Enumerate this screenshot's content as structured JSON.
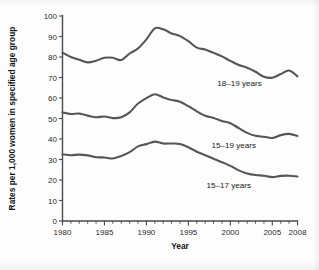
{
  "chart_data": {
    "type": "line",
    "title": "",
    "xlabel": "Year",
    "ylabel": "Rates per 1,000 women in specified age group",
    "xlim": [
      1980,
      2008
    ],
    "ylim": [
      0,
      100
    ],
    "ytick_step": 10,
    "grid": false,
    "legend_position": "inline-annotations",
    "x": [
      1980,
      1981,
      1982,
      1983,
      1984,
      1985,
      1986,
      1987,
      1988,
      1989,
      1990,
      1991,
      1992,
      1993,
      1994,
      1995,
      1996,
      1997,
      1998,
      1999,
      2000,
      2001,
      2002,
      2003,
      2004,
      2005,
      2006,
      2007,
      2008
    ],
    "xticks": [
      1980,
      1985,
      1990,
      1995,
      2000,
      2005,
      2008
    ],
    "xtick_labels": [
      "1980",
      "1985",
      "1990",
      "1995",
      "2000",
      "2005",
      "2008"
    ],
    "yticks": [
      0,
      10,
      20,
      30,
      40,
      50,
      60,
      70,
      80,
      90,
      100
    ],
    "ytick_labels": [
      "0",
      "10",
      "20",
      "30",
      "40",
      "50",
      "60",
      "70",
      "80",
      "90",
      "100"
    ],
    "series": [
      {
        "name": "18–19 years",
        "label": "18–19 years",
        "color": "#565656",
        "label_x": 2001.1,
        "label_y": 66.0,
        "values": [
          82.1,
          80.0,
          78.6,
          77.4,
          78.2,
          79.6,
          79.6,
          78.5,
          81.7,
          84.2,
          88.6,
          94.0,
          93.5,
          91.5,
          90.2,
          87.7,
          84.6,
          83.6,
          82.0,
          80.3,
          78.1,
          76.1,
          74.8,
          72.8,
          70.4,
          69.9,
          71.7,
          73.4,
          70.6
        ]
      },
      {
        "name": "15–19 years",
        "label": "15–19 years",
        "color": "#565656",
        "label_x": 2000.4,
        "label_y": 35.8,
        "values": [
          53.0,
          52.2,
          52.4,
          51.4,
          50.6,
          51.0,
          50.2,
          50.6,
          53.0,
          57.3,
          59.9,
          61.8,
          60.3,
          59.0,
          58.2,
          56.0,
          53.5,
          51.3,
          50.3,
          48.8,
          47.7,
          45.3,
          43.0,
          41.6,
          41.1,
          40.5,
          41.9,
          42.5,
          41.5
        ]
      },
      {
        "name": "15–17 years",
        "label": "15–17 years",
        "color": "#565656",
        "label_x": 1999.8,
        "label_y": 16.0,
        "values": [
          32.5,
          32.1,
          32.4,
          32.0,
          31.1,
          31.0,
          30.5,
          31.7,
          33.6,
          36.4,
          37.5,
          38.7,
          37.8,
          37.8,
          37.6,
          36.0,
          33.8,
          32.1,
          30.4,
          28.7,
          26.9,
          24.7,
          23.2,
          22.4,
          22.1,
          21.4,
          22.0,
          22.1,
          21.7
        ]
      }
    ]
  }
}
